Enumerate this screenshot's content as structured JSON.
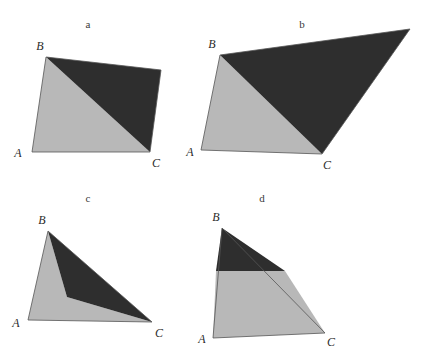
{
  "figure": {
    "width": 426,
    "height": 348,
    "background_color": "#ffffff"
  },
  "style": {
    "light_fill": "#b8b8b8",
    "dark_fill": "#2e2e2e",
    "outline_color": "#555555",
    "outline_width": 0.8,
    "label_color": "#3a3a3a",
    "vertex_label_color": "#2b2b2b"
  },
  "panels": [
    {
      "id": "a",
      "label": "a",
      "label_x": 88,
      "label_y": 28,
      "shape_kind": "quadrilateral-split-by-diagonal",
      "outline_points": "32,152 46,57 161,70 150,152",
      "light_region_points": "32,152 46,57 150,152",
      "dark_region_points": "46,57 161,70 150,152",
      "vertices": [
        {
          "name": "A",
          "label": "A",
          "x": 32,
          "y": 152,
          "label_x": 18,
          "label_y": 157
        },
        {
          "name": "B",
          "label": "B",
          "x": 46,
          "y": 57,
          "label_x": 40,
          "label_y": 50
        },
        {
          "name": "C",
          "label": "C",
          "x": 150,
          "y": 152,
          "label_x": 156,
          "label_y": 167
        }
      ]
    },
    {
      "id": "b",
      "label": "b",
      "label_x": 302,
      "label_y": 28,
      "shape_kind": "quadrilateral-split-by-diagonal",
      "outline_points": "201,150 220,55 410,29 322,154",
      "light_region_points": "201,150 220,55 322,154",
      "dark_region_points": "220,55 410,29 322,154",
      "vertices": [
        {
          "name": "A",
          "label": "A",
          "x": 201,
          "y": 150,
          "label_x": 190,
          "label_y": 156
        },
        {
          "name": "B",
          "label": "B",
          "x": 220,
          "y": 55,
          "label_x": 212,
          "label_y": 48
        },
        {
          "name": "C",
          "label": "C",
          "x": 322,
          "y": 154,
          "label_x": 327,
          "label_y": 169
        }
      ]
    },
    {
      "id": "c",
      "label": "c",
      "label_x": 88,
      "label_y": 202,
      "shape_kind": "triangle-split-by-concave-polyline",
      "outline_points": "28,320 48,231 152,322",
      "light_region_points": "28,320 48,231 67,297 152,322",
      "dark_region_points": "48,231 152,322 67,297",
      "vertices": [
        {
          "name": "A",
          "label": "A",
          "x": 28,
          "y": 320,
          "label_x": 16,
          "label_y": 327
        },
        {
          "name": "B",
          "label": "B",
          "x": 48,
          "y": 231,
          "label_x": 42,
          "label_y": 224
        },
        {
          "name": "C",
          "label": "C",
          "x": 152,
          "y": 322,
          "label_x": 159,
          "label_y": 337
        }
      ]
    },
    {
      "id": "d",
      "label": "d",
      "label_x": 262,
      "label_y": 202,
      "shape_kind": "triangle-split-by-horizontal-cut",
      "outline_points": "213,338 222,228 325,333",
      "light_region_points": "213,338 216,271 285,271 325,333",
      "dark_region_points": "222,228 285,271 216,271",
      "vertices": [
        {
          "name": "A",
          "label": "A",
          "x": 213,
          "y": 338,
          "label_x": 202,
          "label_y": 343
        },
        {
          "name": "B",
          "label": "B",
          "x": 222,
          "y": 228,
          "label_x": 216,
          "label_y": 221
        },
        {
          "name": "C",
          "label": "C",
          "x": 325,
          "y": 333,
          "label_x": 331,
          "label_y": 346
        }
      ]
    }
  ]
}
